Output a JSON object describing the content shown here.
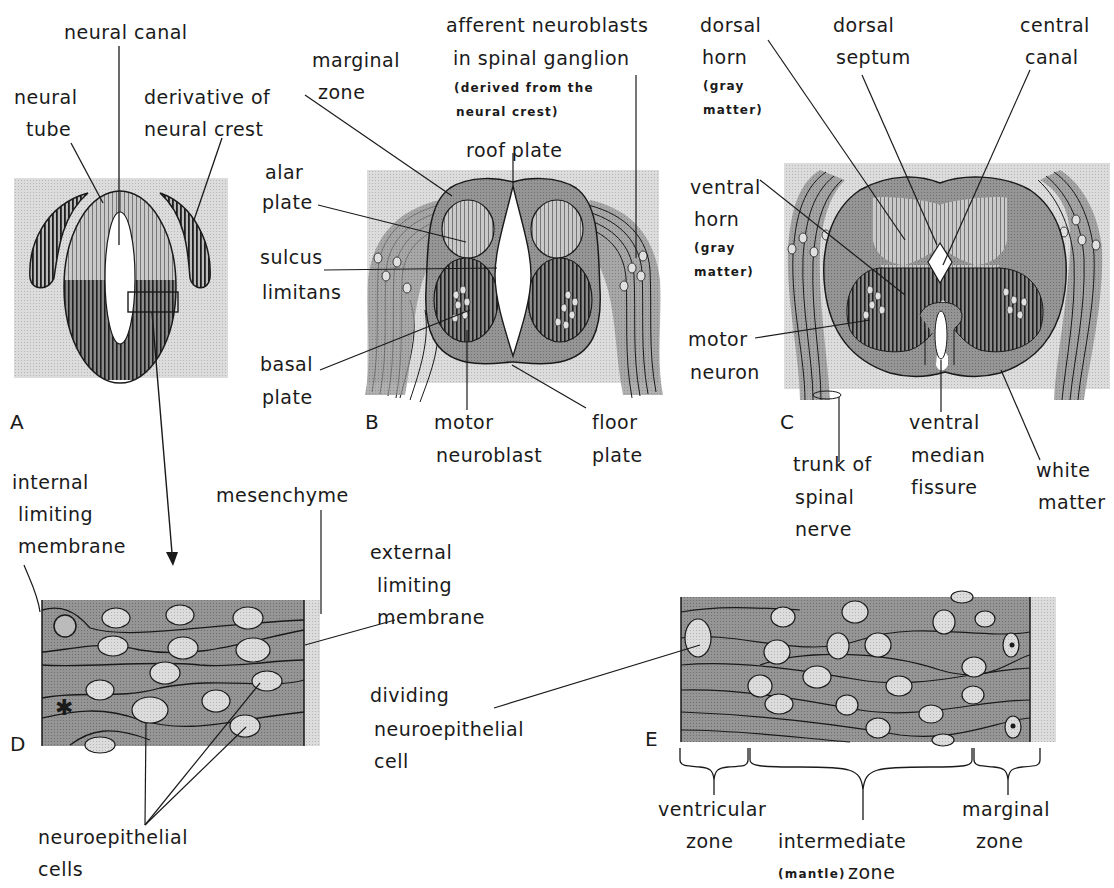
{
  "figure": {
    "panels": [
      "A",
      "B",
      "C",
      "D",
      "E"
    ],
    "colors": {
      "background_stipple": "#d6d6d6",
      "gray_tissue": "#8e8e8e",
      "dark_hatch": "#2a2a2a",
      "light_hatch": "#b8b8b8",
      "nucleus": "#cfcfcf",
      "line": "#1a1a1a"
    }
  },
  "panel_a": {
    "letter": "A",
    "labels": {
      "neural_canal": "neural canal",
      "neural_tube_1": "neural",
      "neural_tube_2": "tube",
      "crest_1": "derivative of",
      "crest_2": "neural crest"
    }
  },
  "panel_b": {
    "letter": "B",
    "labels": {
      "marginal_1": "marginal",
      "marginal_2": "zone",
      "afferent_1": "afferent neuroblasts",
      "afferent_2": "in spinal ganglion",
      "afferent_3": "(derived from the",
      "afferent_4": "neural crest)",
      "roof_plate": "roof plate",
      "alar_1": "alar",
      "alar_2": "plate",
      "sulcus_1": "sulcus",
      "sulcus_2": "limitans",
      "basal_1": "basal",
      "basal_2": "plate",
      "motor_1": "motor",
      "motor_2": "neuroblast",
      "floor_1": "floor",
      "floor_2": "plate"
    }
  },
  "panel_c": {
    "letter": "C",
    "labels": {
      "dorsal_horn_1": "dorsal",
      "dorsal_horn_2": "horn",
      "dorsal_horn_3": "(gray",
      "dorsal_horn_4": "matter)",
      "septum_1": "dorsal",
      "septum_2": "septum",
      "central_1": "central",
      "central_2": "canal",
      "ventral_horn_1": "ventral",
      "ventral_horn_2": "horn",
      "ventral_horn_3": "(gray",
      "ventral_horn_4": "matter)",
      "motor_neuron_1": "motor",
      "motor_neuron_2": "neuron",
      "trunk_1": "trunk of",
      "trunk_2": "spinal",
      "trunk_3": "nerve",
      "fissure_1": "ventral",
      "fissure_2": "median",
      "fissure_3": "fissure",
      "white_1": "white",
      "white_2": "matter"
    }
  },
  "panel_d": {
    "letter": "D",
    "labels": {
      "internal_1": "internal",
      "internal_2": "limiting",
      "internal_3": "membrane",
      "mesenchyme": "mesenchyme",
      "external_1": "external",
      "external_2": "limiting",
      "external_3": "membrane",
      "neuro_1": "neuroepithelial",
      "neuro_2": "cells"
    }
  },
  "panel_e": {
    "letter": "E",
    "labels": {
      "dividing_1": "dividing",
      "dividing_2": "neuroepithelial",
      "dividing_3": "cell",
      "ventricular_1": "ventricular",
      "ventricular_2": "zone",
      "intermediate_1": "intermediate",
      "intermediate_2": "(mantle)",
      "intermediate_3": "zone",
      "marginal_1": "marginal",
      "marginal_2": "zone"
    }
  }
}
